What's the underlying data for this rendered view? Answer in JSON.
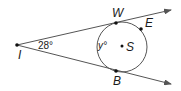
{
  "figure": {
    "type": "geometry",
    "colors": {
      "line": "#555555",
      "point": "#111111",
      "text": "#1a1a1a",
      "background": "#ffffff"
    }
  },
  "points": {
    "I": {
      "label": "I",
      "x": 17,
      "y": 45
    },
    "W": {
      "label": "W",
      "x": 116,
      "y": 23
    },
    "E": {
      "label": "E",
      "x": 141,
      "y": 29
    },
    "S": {
      "label": "S",
      "x": 122,
      "y": 46
    },
    "B": {
      "label": "B",
      "x": 116,
      "y": 71
    }
  },
  "circle": {
    "name": "S",
    "cx": 122,
    "cy": 47,
    "r": 25
  },
  "rays": [
    {
      "from": "I",
      "through": "W",
      "end_x": 171,
      "end_y": 10
    },
    {
      "from": "I",
      "through": "B",
      "end_x": 171,
      "end_y": 84
    }
  ],
  "angles": {
    "outer": {
      "label": "28°",
      "value": 28,
      "vertex": "I"
    },
    "arc": {
      "label": "y°",
      "variable": "y"
    }
  }
}
